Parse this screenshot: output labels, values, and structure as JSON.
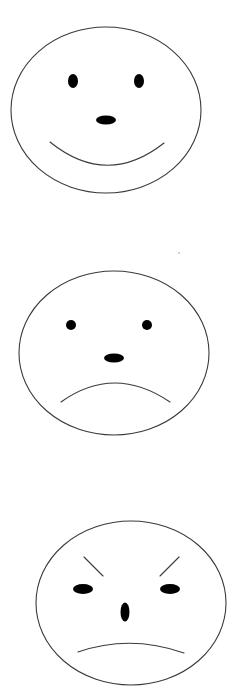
{
  "figure": {
    "description": "Three hand-drawn line-art faces stacked vertically",
    "faces": [
      {
        "label": "happy",
        "outline": {
          "cx": 106,
          "cy": 110,
          "rx": 95,
          "ry": 83
        },
        "eyes": [
          {
            "cx": 73,
            "cy": 81,
            "rx": 5,
            "ry": 7
          },
          {
            "cx": 139,
            "cy": 81,
            "rx": 5,
            "ry": 7
          }
        ],
        "nose": {
          "cx": 106,
          "cy": 120,
          "rx": 10,
          "ry": 4.5
        },
        "mouth_path": "M 50 142 Q 107 188 164 143",
        "mouth_type": "smile"
      },
      {
        "label": "sad",
        "outline": {
          "cx": 114,
          "cy": 353,
          "rx": 95,
          "ry": 82
        },
        "eyes": [
          {
            "cx": 71,
            "cy": 325,
            "rx": 5,
            "ry": 5
          },
          {
            "cx": 147,
            "cy": 325,
            "rx": 5,
            "ry": 5
          }
        ],
        "nose": {
          "cx": 114,
          "cy": 358,
          "rx": 10,
          "ry": 4.5
        },
        "mouth_path": "M 61 402 Q 114 364 170 402",
        "mouth_type": "frown"
      },
      {
        "label": "angry",
        "outline": {
          "cx": 131,
          "cy": 603,
          "rx": 95,
          "ry": 82
        },
        "eyes": [
          {
            "cx": 83,
            "cy": 589,
            "rx": 10,
            "ry": 5
          },
          {
            "cx": 170,
            "cy": 589,
            "rx": 10,
            "ry": 5
          }
        ],
        "nose": {
          "cx": 125,
          "cy": 612,
          "rx": 4.5,
          "ry": 9.5
        },
        "brows": [
          {
            "x1": 84,
            "y1": 557,
            "x2": 103,
            "y2": 576
          },
          {
            "x1": 179,
            "y1": 557,
            "x2": 160,
            "y2": 576
          }
        ],
        "mouth_path": "M 78 652 Q 130 634 184 653",
        "mouth_type": "flat-frown"
      }
    ]
  }
}
